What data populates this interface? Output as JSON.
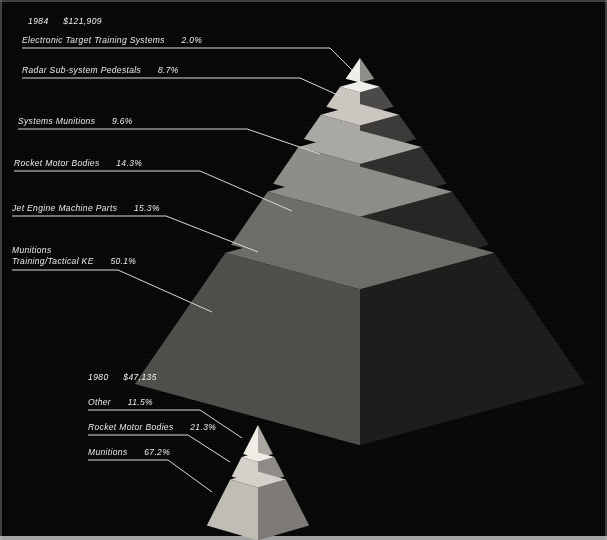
{
  "chart_data": {
    "type": "pie",
    "charts": [
      {
        "name": "1984 pyramid",
        "year": "1984",
        "amount": "$121,909",
        "categories": [
          "Electronic Target Training Systems",
          "Radar Sub-system Pedestals",
          "Systems Munitions",
          "Rocket Motor Bodies",
          "Jet Engine Machine Parts",
          "Munitions Training/Tactical KE"
        ],
        "values": [
          2.0,
          8.7,
          9.6,
          14.3,
          15.3,
          50.1
        ],
        "value_labels": [
          "2.0%",
          "8.7%",
          "9.6%",
          "14.3%",
          "15.3%",
          "50.1%"
        ],
        "total": 100.0
      },
      {
        "name": "1980 pyramid",
        "year": "1980",
        "amount": "$47,135",
        "categories": [
          "Other",
          "Rocket Motor Bodies",
          "Munitions"
        ],
        "values": [
          11.5,
          21.3,
          67.2
        ],
        "value_labels": [
          "11.5%",
          "21.3%",
          "67.2%"
        ],
        "total": 100.0
      }
    ],
    "grid": false,
    "legend": "inline leader labels at left"
  },
  "pyramid_1984": {
    "header": {
      "year": "1984",
      "amount": "$121,909"
    },
    "labels": [
      {
        "name": "Electronic Target Training Systems",
        "pct": "2.0%"
      },
      {
        "name": "Radar Sub-system Pedestals",
        "pct": "8.7%"
      },
      {
        "name": "Systems Munitions",
        "pct": "9.6%"
      },
      {
        "name": "Rocket Motor Bodies",
        "pct": "14.3%"
      },
      {
        "name": "Jet Engine Machine Parts",
        "pct": "15.3%"
      },
      {
        "name_line1": "Munitions",
        "name_line2": "Training/Tactical KE",
        "pct": "50.1%"
      }
    ]
  },
  "pyramid_1980": {
    "header": {
      "year": "1980",
      "amount": "$47,135"
    },
    "labels": [
      {
        "name": "Other",
        "pct": "11.5%"
      },
      {
        "name": "Rocket Motor Bodies",
        "pct": "21.3%"
      },
      {
        "name": "Munitions",
        "pct": "67.2%"
      }
    ]
  },
  "colors": {
    "background": "#050505",
    "rule": "#d8d8d8",
    "text": "#eaeaea",
    "big_layer_left": [
      "#f0eee9",
      "#c9c6bf",
      "#a9a7a1",
      "#8d8b86",
      "#6d6b67",
      "#4e4c49"
    ],
    "big_layer_right": [
      "#8f8d88",
      "#4a4846",
      "#3a3836",
      "#2e2c2b",
      "#242322",
      "#1b1a19"
    ],
    "small_layer_left": [
      "#efece5",
      "#d3d0c9",
      "#bfbcb5"
    ],
    "small_layer_right": [
      "#a9a6a0",
      "#8d8a85",
      "#7c7974"
    ]
  }
}
